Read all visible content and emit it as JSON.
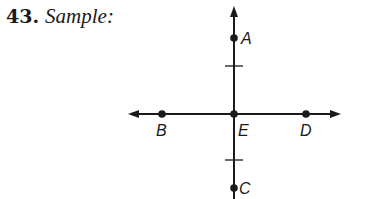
{
  "title": {
    "number": "43.",
    "text": "Sample:"
  },
  "diagram": {
    "stroke_color": "#1a1a1a",
    "origin": {
      "x": 234,
      "y": 114
    },
    "vertical_line": {
      "x": 234,
      "y_top": 6,
      "y_bottom": 199,
      "arrow_top": true
    },
    "horizontal_line": {
      "y": 114,
      "x_left": 128,
      "x_right": 341,
      "arrow_left": true,
      "arrow_right": true
    },
    "points": [
      {
        "label": "A",
        "x": 234,
        "y": 38,
        "label_dx": 7,
        "label_dy": 6
      },
      {
        "label": "B",
        "x": 162,
        "y": 114,
        "label_dx": -6,
        "label_dy": 22
      },
      {
        "label": "E",
        "x": 234,
        "y": 114,
        "label_dx": 4,
        "label_dy": 22
      },
      {
        "label": "D",
        "x": 306,
        "y": 114,
        "label_dx": -6,
        "label_dy": 22
      },
      {
        "label": "C",
        "x": 234,
        "y": 188,
        "label_dx": 5,
        "label_dy": 6
      }
    ],
    "tick_marks": [
      {
        "x": 234,
        "y": 66,
        "half_width": 9
      },
      {
        "x": 234,
        "y": 160,
        "half_width": 9
      }
    ]
  }
}
